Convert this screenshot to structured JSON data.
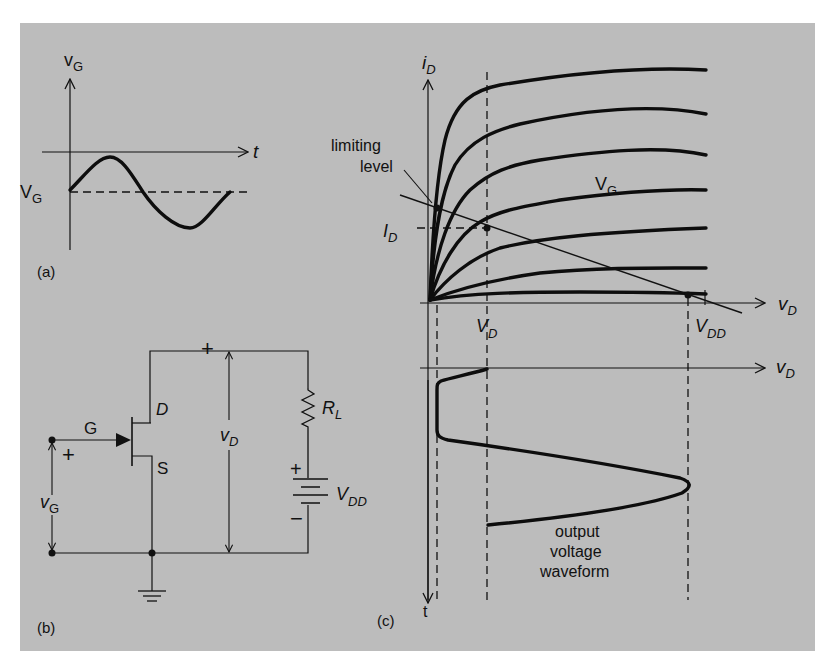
{
  "figure": {
    "background_color": "#bcbcbc",
    "ink_color": "#111111"
  },
  "panel_a": {
    "caption": "(a)",
    "y_axis_label_main": "v",
    "y_axis_label_sub": "G",
    "x_axis_label": "t",
    "bias_label_main": "V",
    "bias_label_sub": "G",
    "waveform": "sinusoidal gate voltage around DC bias V_G"
  },
  "panel_b": {
    "caption": "(b)",
    "gate_label": "G",
    "drain_label": "D",
    "source_label": "S",
    "input_plus": "+",
    "input_label_main": "v",
    "input_label_sub": "G",
    "output_plus": "+",
    "output_label_main": "v",
    "output_label_sub": "D",
    "resistor_label_main": "R",
    "resistor_label_sub": "L",
    "battery_plus": "+",
    "battery_minus": "−",
    "battery_label_main": "V",
    "battery_label_sub": "DD",
    "ground_icon": "ground-symbol"
  },
  "panel_c": {
    "caption": "(c)",
    "y_axis_label_main": "i",
    "y_axis_label_sub": "D",
    "x_axis_label_main": "v",
    "x_axis_label_sub": "D",
    "lower_x_axis_label_main": "v",
    "lower_x_axis_label_sub": "D",
    "time_axis_label": "t",
    "limiting_label_line1": "limiting",
    "limiting_label_line2": "level",
    "family_label_main": "V",
    "family_label_sub": "G",
    "id_label_main": "I",
    "id_label_sub": "D",
    "vd_label_main": "V",
    "vd_label_sub": "D",
    "vdd_label_main": "V",
    "vdd_label_sub": "DD",
    "output_label_line1": "output",
    "output_label_line2": "voltage",
    "output_label_line3": "waveform",
    "curve_count": 7
  }
}
